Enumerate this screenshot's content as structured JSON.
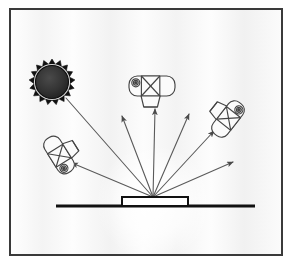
{
  "figure": {
    "caption": "",
    "canvas": {
      "width": 297,
      "height": 271
    },
    "colors": {
      "page_background": "#ffffff",
      "panel_background": "#f7f7f7",
      "panel_border": "#3a3a3a",
      "ink": "#2b2b2b",
      "line": "#555555",
      "ray": "#5a5a5a",
      "sun_fill": "#2a2a2a",
      "sun_rim": "#111111",
      "glow": "#ffffff",
      "camera_stroke": "#444444",
      "camera_fill": "#fbfbfb",
      "surface": "#111111"
    },
    "panel": {
      "x": 10,
      "y": 9,
      "width": 272,
      "height": 246,
      "border_width": 2
    }
  },
  "elements": {
    "sun": {
      "label": "light-source",
      "center_x": 52,
      "center_y": 82,
      "outer_radius": 23,
      "spike_inner_radius": 18,
      "disc_radius": 16.5,
      "spikes": 17
    },
    "glow": {
      "label": "scattering-glow",
      "center_x": 154,
      "center_y": 203,
      "radius": 58
    },
    "surface": {
      "label": "sample-surface-line",
      "x1": 56,
      "x2": 255,
      "y": 206,
      "thickness": 3
    },
    "sample": {
      "label": "sample-slab",
      "x": 122,
      "y": 197,
      "width": 66,
      "height": 9
    },
    "origin": {
      "label": "scattering-point",
      "x": 153,
      "y": 197
    }
  },
  "rays": {
    "incident": {
      "label": "incident-beam",
      "from_x": 66,
      "from_y": 98,
      "to_x": 153,
      "to_y": 197,
      "arrow": "none"
    },
    "scattered": [
      {
        "label": "ray-to-left-camera",
        "to_x": 72,
        "to_y": 163,
        "arrow": "end"
      },
      {
        "label": "ray-upper-left",
        "to_x": 122,
        "to_y": 116,
        "arrow": "end"
      },
      {
        "label": "ray-to-top-camera",
        "to_x": 155,
        "to_y": 109,
        "arrow": "end"
      },
      {
        "label": "ray-upper-right",
        "to_x": 189,
        "to_y": 114,
        "arrow": "end"
      },
      {
        "label": "ray-to-right-camera",
        "to_x": 214,
        "to_y": 131,
        "arrow": "end"
      },
      {
        "label": "ray-far-right",
        "to_x": 233,
        "to_y": 162,
        "arrow": "end"
      }
    ]
  },
  "cameras": [
    {
      "id": "top-camera",
      "label": "camera-top",
      "center_x": 152,
      "center_y": 86,
      "rotation_deg": 0,
      "body_width": 46,
      "body_height": 20,
      "lens_width": 19,
      "lens_height": 11,
      "viewfinder_radius": 4
    },
    {
      "id": "right-camera",
      "label": "camera-right",
      "center_x": 228,
      "center_y": 119,
      "rotation_deg": 128,
      "body_width": 40,
      "body_height": 18,
      "lens_width": 17,
      "lens_height": 10,
      "viewfinder_radius": 4
    },
    {
      "id": "left-camera",
      "label": "camera-left",
      "center_x": 59,
      "center_y": 155,
      "rotation_deg": 238,
      "body_width": 40,
      "body_height": 18,
      "lens_width": 17,
      "lens_height": 10,
      "viewfinder_radius": 4
    }
  ]
}
